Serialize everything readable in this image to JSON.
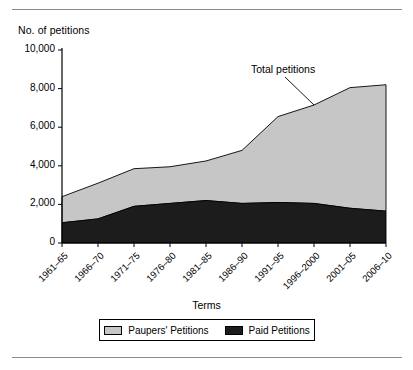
{
  "chart_data": {
    "type": "area",
    "subtype": "stacked-area",
    "title": "",
    "xlabel": "Terms",
    "ylabel": "No. of petitions",
    "ylim": [
      0,
      10000
    ],
    "ytick_labels": [
      "10,000",
      "8,000",
      "6,000",
      "4,000",
      "2,000",
      "0"
    ],
    "ytick_values": [
      10000,
      8000,
      6000,
      4000,
      2000,
      0
    ],
    "grid": false,
    "legend_position": "bottom-center",
    "categories": [
      "1961–65",
      "1966–70",
      "1971–75",
      "1976–80",
      "1981–85",
      "1986–90",
      "1991–95",
      "1996–2000",
      "2001–05",
      "2006–10"
    ],
    "series": [
      {
        "name": "Paid Petitions",
        "color": "#1c1c1c",
        "values": [
          1050,
          1250,
          1900,
          2050,
          2200,
          2050,
          2100,
          2050,
          1800,
          1650
        ]
      },
      {
        "name": "Paupers' Petitions",
        "color": "#c6c6c6",
        "values": [
          1350,
          1850,
          1950,
          1900,
          2050,
          2750,
          4450,
          5100,
          6250,
          6550
        ]
      }
    ],
    "totals": [
      2400,
      3100,
      3850,
      3950,
      4250,
      4800,
      6550,
      7150,
      8050,
      8200
    ],
    "annotations": [
      {
        "text": "Total petitions",
        "target_category": "1996–2000"
      }
    ]
  },
  "axes": {
    "y_title": "No. of petitions",
    "x_title": "Terms"
  },
  "legend": {
    "entries": [
      {
        "label": "Paupers' Petitions",
        "color": "#c6c6c6"
      },
      {
        "label": "Paid Petitions",
        "color": "#1c1c1c"
      }
    ]
  },
  "colors": {
    "paupers": "#c6c6c6",
    "paid": "#1c1c1c",
    "axis": "#000000",
    "rule": "#8a8a8a",
    "background": "#ffffff"
  }
}
